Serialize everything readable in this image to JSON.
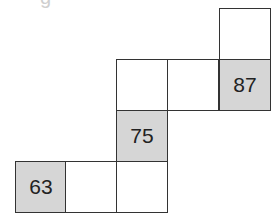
{
  "title_fragment": "g",
  "colors": {
    "shaded": "#d6d6d6",
    "line": "#333333",
    "blank": "#ffffff"
  },
  "grid": {
    "cell_size": 51,
    "cells": [
      {
        "row": 0,
        "col": 4,
        "value": "",
        "shaded": false
      },
      {
        "row": 1,
        "col": 2,
        "value": "",
        "shaded": false
      },
      {
        "row": 1,
        "col": 3,
        "value": "",
        "shaded": false
      },
      {
        "row": 1,
        "col": 4,
        "value": "87",
        "shaded": true
      },
      {
        "row": 2,
        "col": 2,
        "value": "75",
        "shaded": true
      },
      {
        "row": 3,
        "col": 0,
        "value": "63",
        "shaded": true
      },
      {
        "row": 3,
        "col": 1,
        "value": "",
        "shaded": false
      },
      {
        "row": 3,
        "col": 2,
        "value": "",
        "shaded": false
      }
    ]
  }
}
